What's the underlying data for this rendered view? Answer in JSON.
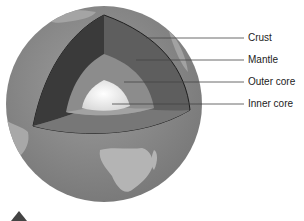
{
  "diagram": {
    "labels": [
      {
        "id": "crust",
        "text": "Crust"
      },
      {
        "id": "mantle",
        "text": "Mantle"
      },
      {
        "id": "outer_core",
        "text": "Outer core"
      },
      {
        "id": "inner_core",
        "text": "Inner core"
      }
    ],
    "colors": {
      "crust": "#8a8a8a",
      "mantle_dark": "#3a3a3a",
      "mantle_mid": "#5e5e5e",
      "outer_core": "#8c8c8c",
      "inner_core": "#f2f2f2",
      "land": "#b4b4b4",
      "ocean": "#888888"
    }
  }
}
